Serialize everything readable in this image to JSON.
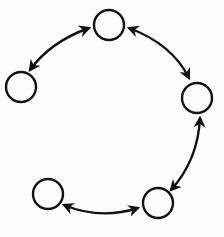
{
  "diagram": {
    "type": "cycle-graph",
    "stroke_color": "#111111",
    "background": "#fdfdfd",
    "node_radius": 15,
    "nodes": [
      {
        "id": "top",
        "cx": 109,
        "cy": 25
      },
      {
        "id": "left",
        "cx": 21,
        "cy": 87
      },
      {
        "id": "right",
        "cx": 197,
        "cy": 98
      },
      {
        "id": "bottom-left",
        "cx": 48,
        "cy": 194
      },
      {
        "id": "bottom-right",
        "cx": 158,
        "cy": 203
      }
    ],
    "edges": [
      {
        "from": "top",
        "to": "left",
        "bidirectional": true,
        "path": "M 89 28 Q 50 42 30 70"
      },
      {
        "from": "top",
        "to": "right",
        "bidirectional": true,
        "path": "M 129 28 Q 172 44 189 78"
      },
      {
        "from": "right",
        "to": "bottom-right",
        "bidirectional": true,
        "path": "M 200 118 Q 198 160 171 190"
      },
      {
        "from": "bottom-right",
        "to": "bottom-left",
        "bidirectional": true,
        "path": "M 138 208 Q 100 220 64 205"
      }
    ]
  }
}
